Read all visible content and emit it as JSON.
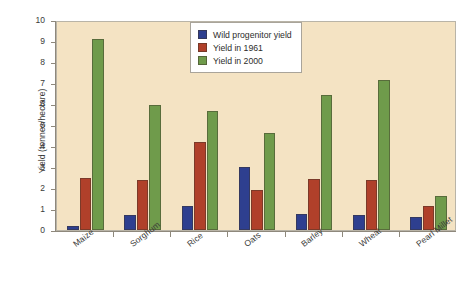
{
  "chart_data": {
    "type": "bar",
    "title": "",
    "xlabel": "",
    "ylabel": "Yield (tonnes/hectare)",
    "ylim": [
      0,
      10
    ],
    "yticks": [
      0,
      1,
      2,
      3,
      4,
      5,
      6,
      7,
      8,
      9,
      10
    ],
    "grid": false,
    "legend_position": "top-center",
    "categories": [
      "Maize",
      "Sorghum",
      "Rice",
      "Oats",
      "Barley",
      "Wheat",
      "Pearl Millet"
    ],
    "series": [
      {
        "name": "Wild progenitor yield",
        "color": "#2e3f8f",
        "values": [
          0.2,
          0.7,
          1.15,
          3.0,
          0.75,
          0.7,
          0.6
        ]
      },
      {
        "name": "Yield in 1961",
        "color": "#b0402a",
        "values": [
          2.5,
          2.4,
          4.2,
          1.9,
          2.45,
          2.4,
          1.15
        ]
      },
      {
        "name": "Yield in 2000",
        "color": "#6f9b4b",
        "values": [
          9.1,
          5.95,
          5.65,
          4.6,
          6.45,
          7.15,
          1.6
        ]
      }
    ],
    "plot_background": "#f4e3c3",
    "figure_background": "#ffffff"
  }
}
